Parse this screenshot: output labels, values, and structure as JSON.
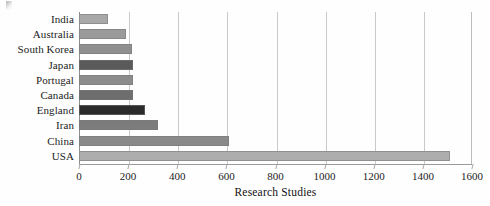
{
  "chart_data": {
    "type": "bar",
    "orientation": "horizontal",
    "title": "",
    "xlabel": "Research Studies",
    "ylabel": "",
    "xlim": [
      0,
      1600
    ],
    "ylim": null,
    "grid": true,
    "legend": false,
    "xticks": [
      0,
      200,
      400,
      600,
      800,
      1000,
      1200,
      1400,
      1600
    ],
    "categories": [
      "India",
      "Australia",
      "South Korea",
      "Japan",
      "Portugal",
      "Canada",
      "England",
      "Iran",
      "China",
      "USA"
    ],
    "values": [
      120,
      190,
      215,
      220,
      220,
      220,
      270,
      320,
      610,
      1510
    ],
    "bar_colors": [
      "#a8a8a8",
      "#9a9a9a",
      "#8f8f8f",
      "#5a5a5a",
      "#8c8c8c",
      "#6e6e6e",
      "#2b2b2b",
      "#7c7c7c",
      "#8a8a8a",
      "#adadad"
    ]
  },
  "axis": {
    "x_title": "Research Studies",
    "tick_labels": [
      "0",
      "200",
      "400",
      "600",
      "800",
      "1000",
      "1200",
      "1400",
      "1600"
    ]
  },
  "style": {
    "grid_color": "#c9c9c9",
    "axis_color": "#9a9a9a",
    "text_color": "#1c1c1c",
    "background": "#fefefe"
  }
}
